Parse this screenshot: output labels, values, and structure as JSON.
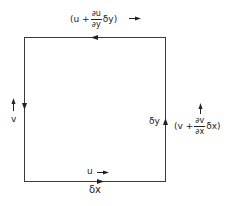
{
  "diagram": {
    "title": "",
    "element": {
      "shape": "square",
      "stroke_color": "#3a3a3a"
    },
    "labels": {
      "top_flow": {
        "open": "(u +",
        "frac_num": "∂u",
        "frac_den": "∂y",
        "tail": "δy)",
        "arrow": "→"
      },
      "right_flow": {
        "open": "(v +",
        "frac_num": "∂v",
        "frac_den": "∂x",
        "tail": "δx)",
        "arrow": "↑"
      },
      "left_flow": {
        "text": "v",
        "arrow": "↑"
      },
      "bottom_flow": {
        "text": "u",
        "arrow": "→"
      },
      "side_height": "δy",
      "side_width": "δx"
    },
    "edge_arrows": [
      {
        "edge": "top",
        "direction": "left"
      },
      {
        "edge": "left",
        "direction": "down"
      },
      {
        "edge": "right",
        "direction": "up"
      },
      {
        "edge": "bottom",
        "direction": "right"
      }
    ]
  }
}
